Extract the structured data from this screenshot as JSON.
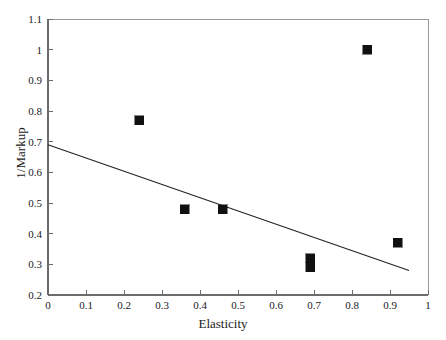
{
  "chart_data": {
    "type": "scatter",
    "title": "",
    "xlabel": "Elasticity",
    "ylabel": "1/Markup",
    "xlim": [
      0,
      1
    ],
    "ylim": [
      0.2,
      1.1
    ],
    "grid": false,
    "legend": "none",
    "x_ticks": [
      "0",
      "0.1",
      "0.2",
      "0.3",
      "0.4",
      "0.5",
      "0.6",
      "0.7",
      "0.8",
      "0.9",
      "1"
    ],
    "x_tick_values": [
      0,
      0.1,
      0.2,
      0.3,
      0.4,
      0.5,
      0.6,
      0.7,
      0.8,
      0.9,
      1.0
    ],
    "y_ticks": [
      "0.2",
      "0.3",
      "0.4",
      "0.5",
      "0.6",
      "0.7",
      "0.8",
      "0.9",
      "1",
      "1.1"
    ],
    "y_tick_values": [
      0.2,
      0.3,
      0.4,
      0.5,
      0.6,
      0.7,
      0.8,
      0.9,
      1.0,
      1.1
    ],
    "marker": {
      "shape": "square",
      "color": "#111111",
      "size_px": 9
    },
    "series": [
      {
        "name": "observations",
        "type": "scatter",
        "points": [
          {
            "x": 0.24,
            "y": 0.77
          },
          {
            "x": 0.36,
            "y": 0.48
          },
          {
            "x": 0.46,
            "y": 0.48
          },
          {
            "x": 0.69,
            "y": 0.32
          },
          {
            "x": 0.69,
            "y": 0.29
          },
          {
            "x": 0.84,
            "y": 1.0
          },
          {
            "x": 0.92,
            "y": 0.37
          }
        ]
      },
      {
        "name": "fitted-regression-line",
        "type": "line",
        "color": "#222222",
        "endpoints": [
          {
            "x": 0.0,
            "y": 0.69
          },
          {
            "x": 0.95,
            "y": 0.28
          }
        ],
        "intercept": 0.69,
        "slope": -0.44
      }
    ],
    "axis": {
      "line_color": "#6b6b6b",
      "spines": [
        "left",
        "bottom",
        "top",
        "right"
      ],
      "tick_direction": "in"
    }
  }
}
